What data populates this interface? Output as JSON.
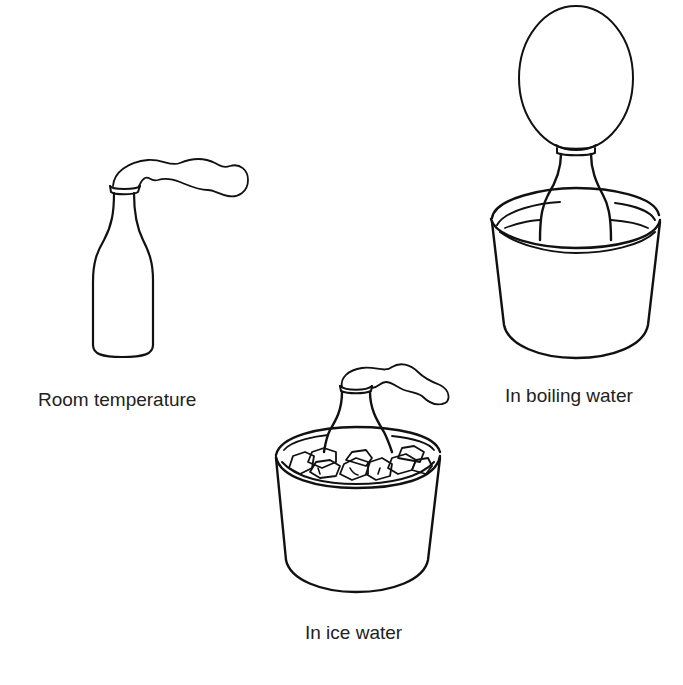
{
  "diagram": {
    "panels": [
      {
        "id": "room",
        "label": "Room temperature",
        "balloon_state": "limp, drooping to the side",
        "container": "none"
      },
      {
        "id": "boiling",
        "label": "In boiling water",
        "balloon_state": "inflated upright oval",
        "container": "pot of water"
      },
      {
        "id": "ice",
        "label": "In ice water",
        "balloon_state": "limp, drooping to the side",
        "container": "pot with ice cubes"
      }
    ],
    "colors": {
      "line": "#111111",
      "background": "#ffffff",
      "text": "#222222"
    }
  }
}
